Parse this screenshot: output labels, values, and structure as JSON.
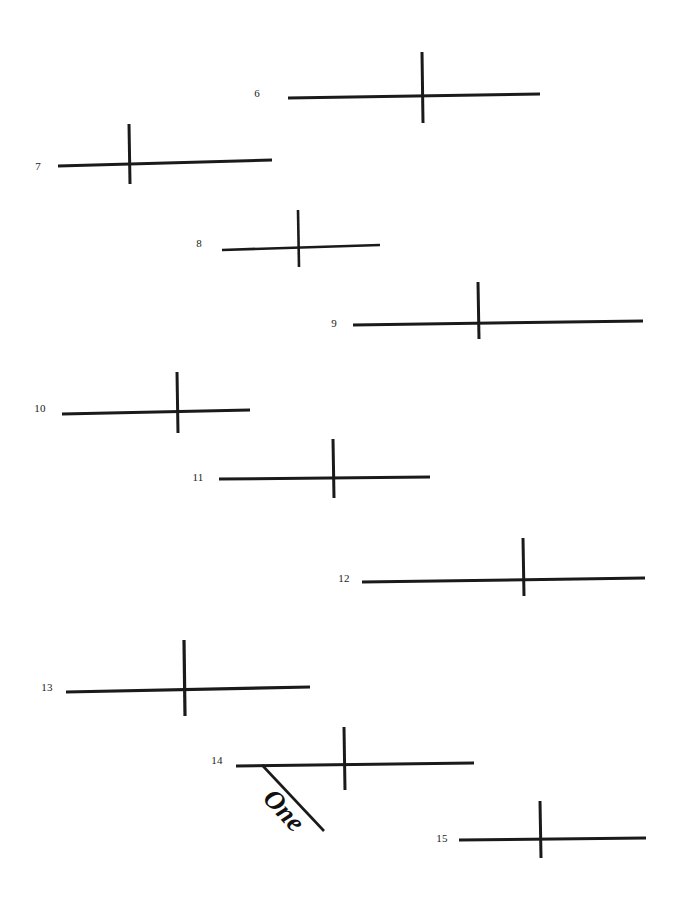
{
  "page": {
    "background_color": "#ffffff",
    "ink_color": "#1a1a1a",
    "width": 683,
    "height": 902
  },
  "figures": [
    {
      "label": "6",
      "label_x": 257,
      "label_y": 93,
      "h_x1": 288,
      "h_y1": 98,
      "h_x2": 540,
      "h_y2": 94,
      "v_x1": 422,
      "v_y1": 52,
      "v_x2": 423,
      "v_y2": 123,
      "stroke": 3.0
    },
    {
      "label": "7",
      "label_x": 38,
      "label_y": 166,
      "h_x1": 58,
      "h_y1": 166,
      "h_x2": 272,
      "h_y2": 160,
      "v_x1": 129,
      "v_y1": 124,
      "v_x2": 130,
      "v_y2": 184,
      "stroke": 3.0
    },
    {
      "label": "8",
      "label_x": 199,
      "label_y": 243,
      "h_x1": 222,
      "h_y1": 250,
      "h_x2": 380,
      "h_y2": 245,
      "v_x1": 298,
      "v_y1": 210,
      "v_x2": 299,
      "v_y2": 267,
      "stroke": 2.6
    },
    {
      "label": "9",
      "label_x": 334,
      "label_y": 323,
      "h_x1": 353,
      "h_y1": 325,
      "h_x2": 643,
      "h_y2": 321,
      "v_x1": 478,
      "v_y1": 282,
      "v_x2": 479,
      "v_y2": 339,
      "stroke": 3.0
    },
    {
      "label": "10",
      "label_x": 40,
      "label_y": 408,
      "h_x1": 62,
      "h_y1": 414,
      "h_x2": 250,
      "h_y2": 410,
      "v_x1": 177,
      "v_y1": 372,
      "v_x2": 178,
      "v_y2": 433,
      "stroke": 3.0
    },
    {
      "label": "11",
      "label_x": 198,
      "label_y": 477,
      "h_x1": 219,
      "h_y1": 479,
      "h_x2": 430,
      "h_y2": 477,
      "v_x1": 333,
      "v_y1": 439,
      "v_x2": 334,
      "v_y2": 498,
      "stroke": 3.0
    },
    {
      "label": "12",
      "label_x": 344,
      "label_y": 578,
      "h_x1": 362,
      "h_y1": 582,
      "h_x2": 645,
      "h_y2": 578,
      "v_x1": 523,
      "v_y1": 538,
      "v_x2": 524,
      "v_y2": 596,
      "stroke": 3.0
    },
    {
      "label": "13",
      "label_x": 47,
      "label_y": 687,
      "h_x1": 66,
      "h_y1": 692,
      "h_x2": 310,
      "h_y2": 687,
      "v_x1": 184,
      "v_y1": 640,
      "v_x2": 185,
      "v_y2": 716,
      "stroke": 3.2
    },
    {
      "label": "14",
      "label_x": 217,
      "label_y": 760,
      "h_x1": 236,
      "h_y1": 766,
      "h_x2": 474,
      "h_y2": 763,
      "v_x1": 344,
      "v_y1": 727,
      "v_x2": 345,
      "v_y2": 790,
      "stroke": 3.0
    },
    {
      "label": "15",
      "label_x": 442,
      "label_y": 838,
      "h_x1": 459,
      "h_y1": 840,
      "h_x2": 646,
      "h_y2": 838,
      "v_x1": 540,
      "v_y1": 801,
      "v_x2": 541,
      "v_y2": 858,
      "stroke": 3.0
    }
  ],
  "annotation": {
    "text": "One",
    "diagonal": {
      "x1": 262,
      "y1": 765,
      "x2": 324,
      "y2": 831,
      "stroke": 2.6
    },
    "text_x": 268,
    "text_y": 778,
    "rotation_deg": 47
  }
}
